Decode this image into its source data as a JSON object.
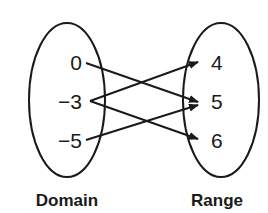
{
  "diagram": {
    "type": "mapping",
    "domain": {
      "label": "Domain",
      "values": [
        "0",
        "−3",
        "−5"
      ]
    },
    "range": {
      "label": "Range",
      "values": [
        "4",
        "5",
        "6"
      ]
    },
    "mappings": [
      {
        "from": "0",
        "to": "5"
      },
      {
        "from": "−3",
        "to": "4"
      },
      {
        "from": "−3",
        "to": "6"
      },
      {
        "from": "−5",
        "to": "5"
      }
    ],
    "colors": {
      "stroke": "#1a1a1a",
      "background": "#ffffff"
    }
  }
}
